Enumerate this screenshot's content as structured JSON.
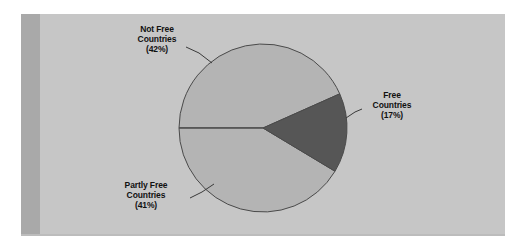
{
  "page": {
    "background_color": "#ffffff"
  },
  "panel": {
    "background_color": "#c6c6c6",
    "left_band_color": "#a9a9a9"
  },
  "chart_data": {
    "type": "pie",
    "title": "",
    "subtitle": "",
    "xlabel": "",
    "ylabel": "",
    "legend_position": "none",
    "labels_position": "outside-with-leader-lines",
    "grid": false,
    "categories": [
      "Not Free Countries",
      "Partly Free Countries",
      "Free Countries"
    ],
    "values": [
      42,
      41,
      17
    ],
    "value_unit": "percent",
    "slices": [
      {
        "name": "not-free",
        "label_line1": "Not Free",
        "label_line2": "Countries",
        "label_line3": "(42%)",
        "value": 42,
        "value_text": "(42%)",
        "color": "#b4b4b4",
        "start_angle_deg": -24,
        "end_angle_deg": -180
      },
      {
        "name": "partly-free",
        "label_line1": "Partly Free",
        "label_line2": "Countries",
        "label_line3": "(41%)",
        "value": 41,
        "value_text": "(41%)",
        "color": "#b4b4b4",
        "start_angle_deg": 180,
        "end_angle_deg": 31
      },
      {
        "name": "free",
        "label_line1": "Free",
        "label_line2": "Countries",
        "label_line3": "(17%)",
        "value": 17,
        "value_text": "(17%)",
        "color": "#565656",
        "start_angle_deg": -24,
        "end_angle_deg": 31
      }
    ],
    "geometry": {
      "center_x": 263,
      "center_y": 128,
      "radius": 84,
      "outline_color": "#4a4a4a"
    }
  }
}
